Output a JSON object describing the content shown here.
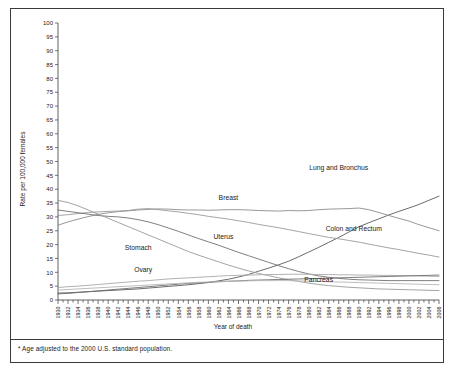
{
  "figure": {
    "footnote": "* Age adjusted to the 2000 U.S. standard population."
  },
  "chart_data": {
    "type": "line",
    "title": "",
    "xlabel": "Year of death",
    "ylabel": "Rate per 100,000 females",
    "xlim": [
      1930,
      2006
    ],
    "ylim": [
      0,
      100
    ],
    "ytick_step": 5,
    "xtick_step": 2,
    "grid": false,
    "legend_position": "inline-annotations",
    "ytick_labels": [
      "0",
      "5",
      "10",
      "15",
      "20",
      "25",
      "30",
      "35",
      "40",
      "45",
      "50",
      "55",
      "60",
      "65",
      "70",
      "75",
      "80",
      "85",
      "90",
      "95",
      "100"
    ],
    "xtick_labels": [
      "1930",
      "1932",
      "1934",
      "1936",
      "1938",
      "1940",
      "1942",
      "1944",
      "1946",
      "1948",
      "1950",
      "1952",
      "1954",
      "1956",
      "1958",
      "1960",
      "1962",
      "1964",
      "1966",
      "1968",
      "1970",
      "1972",
      "1974",
      "1976",
      "1978",
      "1980",
      "1982",
      "1984",
      "1986",
      "1988",
      "1990",
      "1992",
      "1994",
      "1996",
      "1998",
      "2000",
      "2002",
      "2004",
      "2006"
    ],
    "x": [
      1930,
      1932,
      1934,
      1936,
      1938,
      1940,
      1942,
      1944,
      1946,
      1948,
      1950,
      1952,
      1954,
      1956,
      1958,
      1960,
      1962,
      1964,
      1966,
      1968,
      1970,
      1972,
      1974,
      1976,
      1978,
      1980,
      1982,
      1984,
      1986,
      1988,
      1990,
      1992,
      1994,
      1996,
      1998,
      2000,
      2002,
      2004,
      2006
    ],
    "series": [
      {
        "name": "Lung and Bronchus",
        "color": "#5a5a5a",
        "label_x": 1986,
        "label_y": 47,
        "values": [
          2.5,
          2.6,
          2.8,
          3.0,
          3.2,
          3.4,
          3.6,
          3.8,
          4.0,
          4.3,
          4.6,
          4.9,
          5.2,
          5.5,
          5.9,
          6.3,
          6.9,
          7.5,
          8.3,
          9.2,
          10.4,
          11.5,
          12.7,
          14.0,
          15.6,
          17.3,
          19.0,
          20.8,
          22.6,
          24.5,
          26.4,
          27.9,
          29.3,
          30.7,
          32.0,
          33.2,
          34.5,
          36.0,
          37.5
        ]
      },
      {
        "name": "Breast",
        "color": "#8c8c8c",
        "label_x": 1964,
        "label_y": 36,
        "values": [
          27.0,
          28.2,
          29.2,
          30.1,
          30.9,
          31.5,
          31.9,
          32.2,
          32.5,
          32.7,
          32.9,
          32.8,
          32.6,
          32.5,
          32.5,
          32.4,
          32.5,
          32.6,
          32.6,
          32.5,
          32.3,
          32.2,
          32.1,
          32.3,
          32.2,
          32.3,
          32.6,
          32.8,
          32.9,
          33.0,
          33.2,
          32.6,
          31.6,
          30.5,
          29.5,
          28.5,
          27.2,
          26.1,
          25.0
        ]
      },
      {
        "name": "Colon and Rectum",
        "color": "#9a9a9a",
        "label_x": 1989,
        "label_y": 25,
        "values": [
          30.5,
          30.8,
          31.2,
          31.6,
          31.8,
          32.0,
          32.1,
          32.3,
          32.8,
          33.0,
          32.6,
          32.2,
          31.8,
          31.3,
          30.8,
          30.2,
          29.7,
          29.2,
          28.6,
          28.0,
          27.3,
          26.7,
          26.1,
          25.4,
          24.7,
          24.0,
          23.3,
          22.6,
          22.1,
          21.5,
          20.9,
          20.2,
          19.5,
          18.8,
          18.2,
          17.5,
          16.8,
          16.2,
          15.5
        ]
      },
      {
        "name": "Uterus",
        "color": "#707070",
        "label_x": 1963,
        "label_y": 22,
        "values": [
          32.5,
          32.0,
          31.5,
          31.0,
          30.5,
          30.2,
          30.0,
          29.6,
          29.0,
          28.2,
          27.2,
          26.0,
          24.8,
          23.5,
          22.2,
          21.0,
          19.8,
          18.5,
          17.2,
          16.0,
          14.8,
          13.6,
          12.4,
          11.3,
          10.3,
          9.4,
          8.7,
          8.2,
          7.8,
          7.5,
          7.3,
          7.2,
          7.1,
          7.0,
          7.0,
          7.0,
          7.0,
          7.0,
          7.0
        ]
      },
      {
        "name": "Stomach",
        "color": "#989898",
        "label_x": 1946,
        "label_y": 18,
        "values": [
          36.0,
          35.2,
          34.0,
          32.5,
          31.0,
          29.5,
          28.0,
          26.5,
          25.0,
          23.5,
          22.0,
          20.5,
          19.0,
          17.5,
          16.2,
          15.0,
          13.8,
          12.6,
          11.5,
          10.5,
          9.6,
          8.8,
          8.0,
          7.3,
          6.7,
          6.1,
          5.6,
          5.2,
          4.9,
          4.6,
          4.4,
          4.2,
          4.0,
          3.9,
          3.8,
          3.7,
          3.6,
          3.5,
          3.4
        ]
      },
      {
        "name": "Ovary",
        "color": "#a8a8a8",
        "label_x": 1947,
        "label_y": 10,
        "values": [
          4.5,
          4.8,
          5.0,
          5.3,
          5.6,
          5.9,
          6.2,
          6.5,
          6.8,
          7.0,
          7.3,
          7.6,
          7.8,
          8.0,
          8.2,
          8.4,
          8.6,
          8.8,
          8.9,
          9.0,
          9.1,
          9.2,
          9.2,
          9.3,
          9.3,
          9.3,
          9.2,
          9.2,
          9.1,
          9.1,
          9.0,
          9.0,
          8.9,
          8.9,
          8.8,
          8.8,
          8.7,
          8.6,
          8.5
        ]
      },
      {
        "name": "Pancreas",
        "color": "#6e6e6e",
        "label_x": 1982,
        "label_y": 6.5,
        "values": [
          2.2,
          2.4,
          2.7,
          3.0,
          3.3,
          3.6,
          3.9,
          4.2,
          4.5,
          4.8,
          5.1,
          5.4,
          5.7,
          6.0,
          6.2,
          6.4,
          6.6,
          6.8,
          6.9,
          7.1,
          7.2,
          7.3,
          7.4,
          7.5,
          7.6,
          7.7,
          7.8,
          7.9,
          8.0,
          8.1,
          8.2,
          8.3,
          8.4,
          8.5,
          8.6,
          8.7,
          8.8,
          8.9,
          9.0
        ]
      },
      {
        "name": "Low line",
        "color": "#b5b5b5",
        "label_x": null,
        "label_y": null,
        "values": [
          3.6,
          3.8,
          4.0,
          4.2,
          4.4,
          4.6,
          4.8,
          5.0,
          5.2,
          5.4,
          5.6,
          5.8,
          6.0,
          6.2,
          6.4,
          6.5,
          6.6,
          6.7,
          6.8,
          6.9,
          7.0,
          7.0,
          7.0,
          7.0,
          6.9,
          6.8,
          6.7,
          6.6,
          6.5,
          6.4,
          6.3,
          6.2,
          6.1,
          6.0,
          5.9,
          5.8,
          5.7,
          5.6,
          5.5
        ]
      }
    ]
  }
}
